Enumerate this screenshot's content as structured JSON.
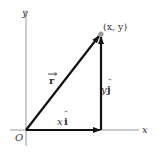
{
  "diagram": {
    "type": "vector-decomposition",
    "axes": {
      "x_label": "x",
      "y_label": "y",
      "origin_label": "O"
    },
    "point_label": "(x, y)",
    "vectors": {
      "r": {
        "label": "r",
        "from": "O",
        "to": "(x, y)"
      },
      "x_component": {
        "label_var": "x",
        "label_unit": "i"
      },
      "y_component": {
        "label_var": "y",
        "label_unit": "j"
      }
    },
    "colors": {
      "axis": "#888888",
      "vector": "#111111",
      "point": "#999999",
      "text": "#333333"
    }
  }
}
